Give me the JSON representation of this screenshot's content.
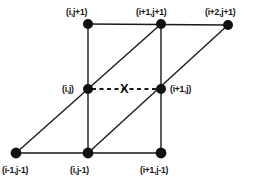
{
  "figure": {
    "type": "grid-stencil-diagram",
    "width": 254,
    "height": 181,
    "background_color": "#ffffff",
    "line_color": "#1a1a1a",
    "node_color": "#111111",
    "node_radius": 5,
    "marker": {
      "label": "X",
      "x": 125,
      "y": 89,
      "style": "bold-serifless-cross"
    },
    "nodes": [
      {
        "id": "n-i-jp1",
        "label": "(i,j+1)",
        "x": 88,
        "y": 24,
        "label_x": 66,
        "label_y": 8
      },
      {
        "id": "n-ip1-jp1",
        "label": "(i+1,j+1)",
        "x": 161,
        "y": 24,
        "label_x": 136,
        "label_y": 8
      },
      {
        "id": "n-ip2-jp1",
        "label": "(i+2,j+1)",
        "x": 228,
        "y": 25,
        "label_x": 205,
        "label_y": 8
      },
      {
        "id": "n-i-j",
        "label": "(i,j)",
        "x": 88,
        "y": 89,
        "label_x": 62,
        "label_y": 85
      },
      {
        "id": "n-ip1-j",
        "label": "(i+1,j)",
        "x": 161,
        "y": 89,
        "label_x": 170,
        "label_y": 85
      },
      {
        "id": "n-im1-jm1",
        "label": "(i-1,j-1)",
        "x": 16,
        "y": 153,
        "label_x": 2,
        "label_y": 166
      },
      {
        "id": "n-i-jm1",
        "label": "(i,j-1)",
        "x": 88,
        "y": 153,
        "label_x": 70,
        "label_y": 166
      },
      {
        "id": "n-ip1-jm1",
        "label": "(i+1,j-1)",
        "x": 161,
        "y": 153,
        "label_x": 140,
        "label_y": 166
      }
    ],
    "edges": [
      {
        "id": "edge-top-horizontal",
        "from": "n-i-jp1",
        "to": "n-ip2-jp1",
        "style": "solid"
      },
      {
        "id": "edge-bottom-horizontal",
        "from": "n-im1-jm1",
        "to": "n-ip1-jm1",
        "style": "solid"
      },
      {
        "id": "edge-left-vertical",
        "from": "n-i-jp1",
        "to": "n-i-jm1",
        "style": "solid"
      },
      {
        "id": "edge-right-vertical",
        "from": "n-ip1-jp1",
        "to": "n-ip1-jm1",
        "style": "solid"
      },
      {
        "id": "edge-left-diagonal",
        "from": "n-im1-jm1",
        "to": "n-ip1-jp1",
        "style": "solid"
      },
      {
        "id": "edge-right-diagonal",
        "from": "n-i-jm1",
        "to": "n-ip2-jp1",
        "style": "solid"
      },
      {
        "id": "edge-center-dashed",
        "from": "n-i-j",
        "to": "n-ip1-j",
        "style": "dashed"
      }
    ]
  }
}
